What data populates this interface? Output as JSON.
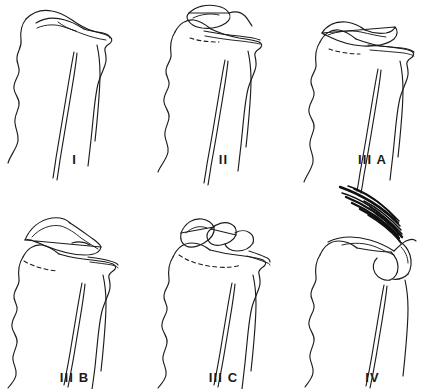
{
  "figure": {
    "background_color": "#ffffff",
    "ink_color": "#1b1b1b",
    "columns": 3,
    "rows": 2
  },
  "panels": [
    {
      "id": "type-1",
      "label": "I",
      "description": "Scapula and clavicle in normal alignment; acromioclavicular joint intact with clavicle resting flush on the acromion.",
      "displacement": "none",
      "has_dashed_reference_line": false,
      "has_muscle_hatching": false
    },
    {
      "id": "type-2",
      "label": "II",
      "description": "Distal clavicle slightly elevated above the acromion; dashed line marks the original clavicle position.",
      "displacement": "slight superior",
      "has_dashed_reference_line": true,
      "has_muscle_hatching": false
    },
    {
      "id": "type-3a",
      "label": "III A",
      "description": "Clavicle displaced superiorly, overriding the acromion; dashed line marks the original clavicle position.",
      "displacement": "moderate superior",
      "has_dashed_reference_line": true,
      "has_muscle_hatching": false
    },
    {
      "id": "type-3b",
      "label": "III B",
      "description": "Clavicle displaced superiorly at a steeper angle, tilted well above the acromion; dashed line marks the original position.",
      "displacement": "marked superior with upward tilt",
      "has_dashed_reference_line": true,
      "has_muscle_hatching": false
    },
    {
      "id": "type-3c",
      "label": "III C",
      "description": "Severe superior displacement with comminution of the distal clavicle; dashed line marks the original position.",
      "displacement": "severe superior, comminuted",
      "has_dashed_reference_line": true,
      "has_muscle_hatching": false
    },
    {
      "id": "type-4",
      "label": "IV",
      "description": "Posterior displacement of the clavicle through the trapezius, drawn with fanned hatching representing muscle fibres.",
      "displacement": "posterior through trapezius",
      "has_dashed_reference_line": false,
      "has_muscle_hatching": true
    }
  ]
}
